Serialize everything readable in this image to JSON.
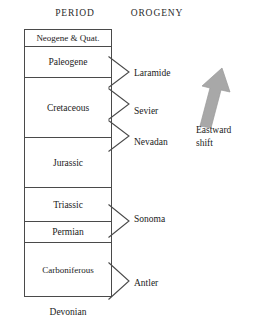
{
  "headers": {
    "period": "PERIOD",
    "orogeny": "OROGENY"
  },
  "colors": {
    "line": "#4a4a4a",
    "text": "#1a1a1a",
    "arrow_fill": "#a8a8a8",
    "arrow_edge": "#8f8f8f",
    "background": "#ffffff"
  },
  "periods": [
    {
      "label": "Neogene & Quat.",
      "top": 0,
      "height": 17
    },
    {
      "label": "Paleogene",
      "top": 17,
      "height": 31
    },
    {
      "label": "Cretaceous",
      "top": 48,
      "height": 60
    },
    {
      "label": "Jurassic",
      "top": 108,
      "height": 50
    },
    {
      "label": "Triassic",
      "top": 158,
      "height": 34
    },
    {
      "label": "Permian",
      "top": 192,
      "height": 21
    },
    {
      "label": "Carboniferous",
      "top": 213,
      "height": 54
    },
    {
      "label": "Devonian",
      "top": 267,
      "height": 29
    }
  ],
  "orogenies": [
    {
      "label": "Laramide",
      "label_top": 68,
      "chev_top": 56,
      "chev_height": 32
    },
    {
      "label": "Sevier",
      "label_top": 106,
      "chev_top": 88,
      "chev_height": 32
    },
    {
      "label": "Nevadan",
      "label_top": 137,
      "chev_top": 120,
      "chev_height": 32
    },
    {
      "label": "Sonoma",
      "label_top": 214,
      "chev_top": 204,
      "chev_height": 34
    },
    {
      "label": "Antler",
      "label_top": 278,
      "chev_top": 262,
      "chev_height": 38
    }
  ],
  "eastward_shift": {
    "line1": "Eastward",
    "line2": "shift",
    "direction": "up-right"
  }
}
